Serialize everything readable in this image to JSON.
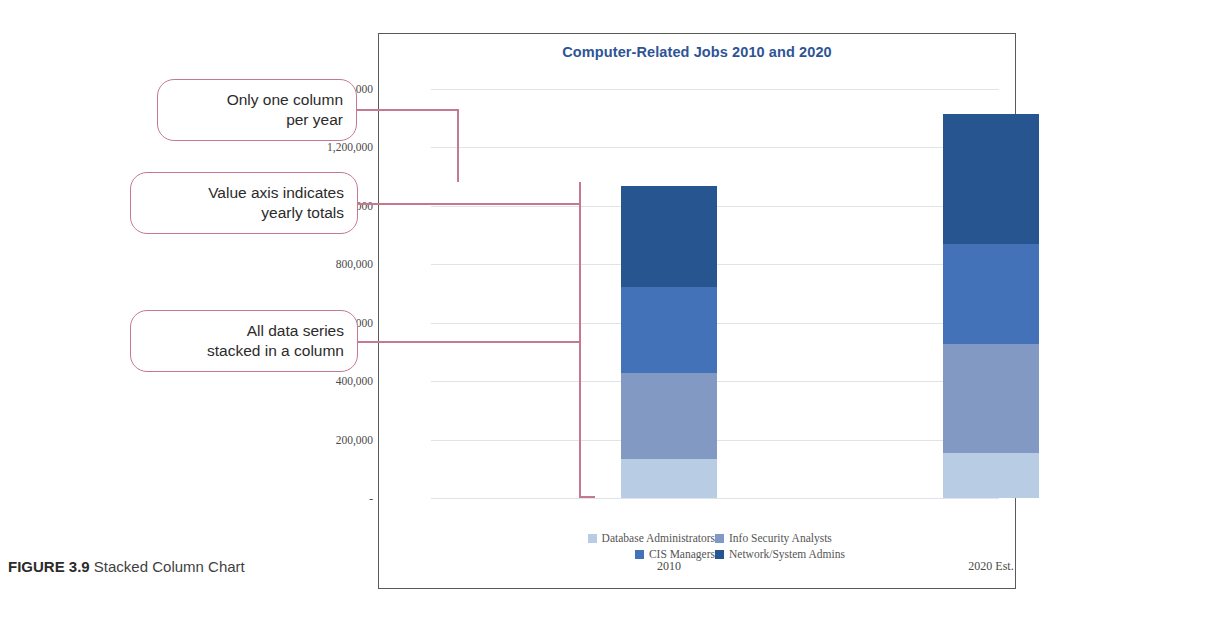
{
  "caption": {
    "figure_label": "FIGURE 3.9",
    "figure_text": " Stacked Column Chart"
  },
  "callouts": [
    {
      "id": "only-one-column-per-year",
      "line1": "Only one column",
      "line2": "per year"
    },
    {
      "id": "value-axis-yearly-totals",
      "line1": "Value axis indicates",
      "line2": "yearly totals"
    },
    {
      "id": "all-data-series-stacked",
      "line1": "All data series",
      "line2": "stacked in a column"
    }
  ],
  "colors": {
    "title": "#2e5496",
    "callout_border": "#c4798f",
    "gridline": "#dfe4ea",
    "panel_border": "#5a5a5a",
    "database_administrators": "#b8cce4",
    "info_security_analysts": "#8299c4",
    "cis_managers": "#4372b8",
    "network_system_admins": "#26558f"
  },
  "chart_data": {
    "type": "bar",
    "subtype": "stacked-column",
    "title": "Computer-Related Jobs 2010 and 2020",
    "xlabel": "",
    "ylabel": "",
    "categories": [
      "2010",
      "2020 Est."
    ],
    "ylim": [
      0,
      1400000
    ],
    "yticks": [
      0,
      200000,
      400000,
      600000,
      800000,
      1000000,
      1200000,
      1400000
    ],
    "ytick_labels": [
      "-",
      "200,000",
      "400,000",
      "600,000",
      "800,000",
      "1,000,000",
      "1,200,000",
      "1,400,000"
    ],
    "grid": true,
    "legend_position": "bottom",
    "series": [
      {
        "name": "Database Administrators",
        "color": "#b8cce4",
        "values": [
          133000,
          154000
        ]
      },
      {
        "name": "Info Security Analysts",
        "color": "#8299c4",
        "values": [
          294000,
          372000
        ]
      },
      {
        "name": "CIS Managers",
        "color": "#4372b8",
        "values": [
          294000,
          342000
        ]
      },
      {
        "name": "Network/System Admins",
        "color": "#26558f",
        "values": [
          347000,
          447000
        ]
      }
    ],
    "totals": [
      1068000,
      1315000
    ]
  }
}
